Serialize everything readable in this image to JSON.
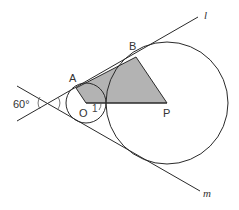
{
  "diagram": {
    "background": "#ffffff",
    "shade_color": "#b3b3b3",
    "line_color": "#2a2a2a",
    "labels": {
      "angle": "60°",
      "A": "A",
      "B": "B",
      "O": "O",
      "P": "P",
      "one": "1",
      "l": "l",
      "m": "m"
    },
    "points": {
      "vertex": [
        49,
        103
      ],
      "O": [
        86,
        103
      ],
      "P": [
        167,
        103
      ],
      "A": [
        76,
        88
      ],
      "B": [
        136,
        57
      ]
    },
    "circles": {
      "small": {
        "center": "O",
        "radius": 20
      },
      "large": {
        "center": "P",
        "radius": 61
      }
    },
    "lines": {
      "l": {
        "from": [
          17,
          121
        ],
        "to": [
          198,
          17
        ]
      },
      "m": {
        "from": [
          17,
          86
        ],
        "to": [
          200,
          191
        ]
      }
    },
    "shaded_region": "quadrilateral A-B-P-O"
  }
}
